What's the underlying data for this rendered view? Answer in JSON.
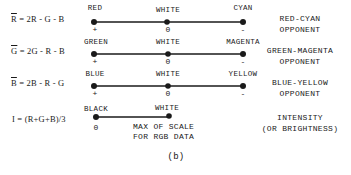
{
  "figure": {
    "caption": "(b)",
    "rows": [
      {
        "equation": {
          "symbol": "R",
          "rhs": " = 2R - G - B"
        },
        "left": {
          "label": "RED",
          "sign": "+"
        },
        "middle": {
          "label": "WHITE",
          "sign": "0"
        },
        "right": {
          "label": "CYAN",
          "sign": "-"
        },
        "description": [
          "RED-CYAN",
          "OPPONENT"
        ]
      },
      {
        "equation": {
          "symbol": "G",
          "rhs": " = 2G - R - B"
        },
        "left": {
          "label": "GREEN",
          "sign": "+"
        },
        "middle": {
          "label": "WHITE",
          "sign": "0"
        },
        "right": {
          "label": "MAGENTA",
          "sign": "-"
        },
        "description": [
          "GREEN-MAGENTA",
          "OPPONENT"
        ]
      },
      {
        "equation": {
          "symbol": "B",
          "rhs": " = 2B - R - G"
        },
        "left": {
          "label": "BLUE",
          "sign": "+"
        },
        "middle": {
          "label": "WHITE",
          "sign": "0"
        },
        "right": {
          "label": "YELLOW",
          "sign": "-"
        },
        "description": [
          "BLUE-YELLOW",
          "OPPONENT"
        ]
      },
      {
        "equation": {
          "symbol": "",
          "rhs": "I = (R+G+B)/3"
        },
        "left": {
          "label": "BLACK",
          "sign": "0"
        },
        "middle": {
          "label": "WHITE",
          "note": [
            "MAX OF SCALE",
            "FOR RGB DATA"
          ]
        },
        "description": [
          "INTENSITY",
          "(OR BRIGHTNESS)"
        ]
      }
    ]
  },
  "colors": {
    "ink": "#1a1a1a",
    "background": "#ffffff"
  }
}
